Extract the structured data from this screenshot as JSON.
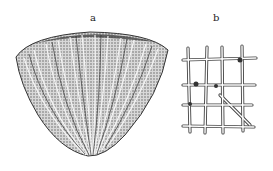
{
  "figure": {
    "panels": [
      {
        "label": "a",
        "subject": "cone-shaped ribbed fossil specimen"
      },
      {
        "label": "b",
        "subject": "lattice skeletal structure fragment"
      }
    ]
  }
}
